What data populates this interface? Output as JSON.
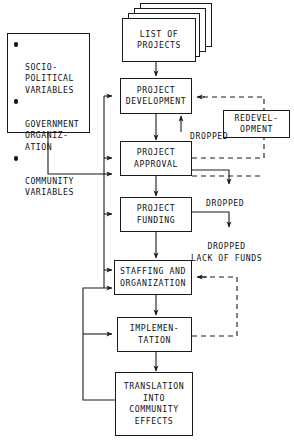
{
  "diagram": {
    "line_color": "#1a1a1a",
    "text_color": "#111111",
    "background": "#ffffff"
  },
  "factors_box": {
    "name": "contextual-variables",
    "items": [
      "SOCIO-\nPOLITICAL\nVARIABLES",
      "GOVERNMENT\nORGANIZ-\nATION",
      "COMMUNITY\nVARIABLES"
    ]
  },
  "nodes": {
    "list_of_projects": "LIST OF\nPROJECTS",
    "project_development": "PROJECT\nDEVELOPMENT",
    "project_approval": "PROJECT\nAPPROVAL",
    "project_funding": "PROJECT\nFUNDING",
    "staffing_and_organization": "STAFFING AND\nORGANIZATION",
    "implementation": "IMPLEMEN-\nTATION",
    "translation": "TRANSLATION\nINTO\nCOMMUNITY\nEFFECTS",
    "redevelopment": "REDEVEL-\nOPMENT"
  },
  "edge_labels": {
    "dropped_development": "DROPPED",
    "dropped_approval": "DROPPED",
    "dropped_funding": "DROPPED\nLACK OF FUNDS"
  },
  "stack": {
    "card_count": 4
  }
}
